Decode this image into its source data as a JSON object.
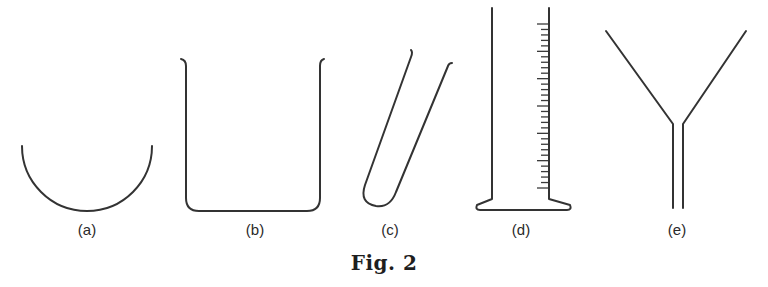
{
  "figure": {
    "caption": "Fig. 2",
    "stroke_color": "#333333",
    "items": [
      {
        "id": "a",
        "label": "(a)",
        "shape": "semicircular-bowl"
      },
      {
        "id": "b",
        "label": "(b)",
        "shape": "beaker"
      },
      {
        "id": "c",
        "label": "(c)",
        "shape": "test-tube"
      },
      {
        "id": "d",
        "label": "(d)",
        "shape": "measuring-cylinder",
        "graduation_marks": 31
      },
      {
        "id": "e",
        "label": "(e)",
        "shape": "funnel"
      }
    ]
  }
}
